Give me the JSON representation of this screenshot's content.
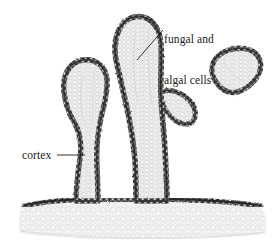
{
  "figure": {
    "name": "lichen-thallus-cross-section",
    "background_color": "#ffffff",
    "ink_color": "#1a1a1a",
    "cortex_color": "#3a3a3a",
    "medulla_color": "#d8d8d8",
    "width": 280,
    "height": 242
  },
  "labels": {
    "fungal_algal": {
      "line1": "fungal and",
      "line2": "algal cells"
    },
    "cortex": "cortex"
  },
  "structures": {
    "left_lobe": "left-lobe",
    "center_lobe": "center-lobe",
    "right_lobe": "right-lobe",
    "basal_thallus": "basal-thallus",
    "side_branch": "side-branch"
  },
  "leader_lines": {
    "fungal_algal": "leader-line-fungal-algal",
    "cortex": "leader-line-cortex"
  }
}
